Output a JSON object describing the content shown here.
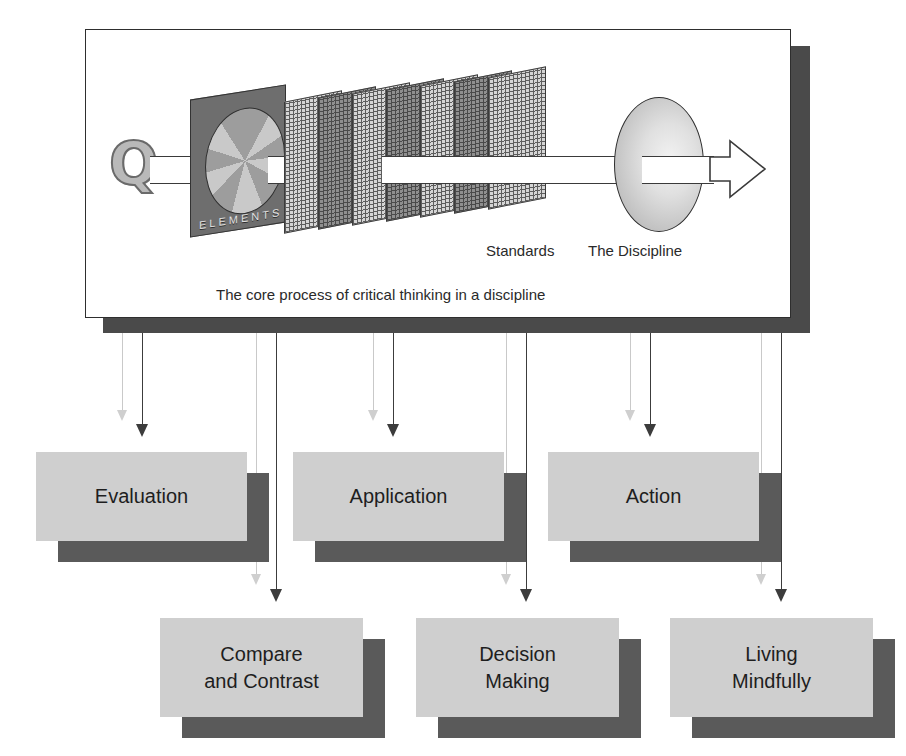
{
  "diagram": {
    "title": "The core process of critical thinking in a discipline",
    "top_panel": {
      "caption": "The core process of critical thinking in a discipline",
      "input_symbol": "Q",
      "elements_panel_label": "ELEMENTS",
      "stack_label_standards": "Standards",
      "stack_label_discipline": "The Discipline",
      "screen_count": 7
    },
    "row_one_boxes": [
      {
        "label": "Evaluation"
      },
      {
        "label": "Application"
      },
      {
        "label": "Action"
      }
    ],
    "row_two_boxes": [
      {
        "line1": "Compare",
        "line2": "and Contrast"
      },
      {
        "line1": "Decision",
        "line2": "Making"
      },
      {
        "line1": "Living",
        "line2": "Mindfully"
      }
    ],
    "colors": {
      "box_fill": "#cfcfcf",
      "box_shadow": "#5a5a5a",
      "frame_shadow": "#4a4a4a",
      "elements_panel": "#6e6e6e",
      "arrow_dark": "#3c3c3c",
      "arrow_ghost": "#cfcfcf",
      "text": "#1e1e1e"
    }
  }
}
